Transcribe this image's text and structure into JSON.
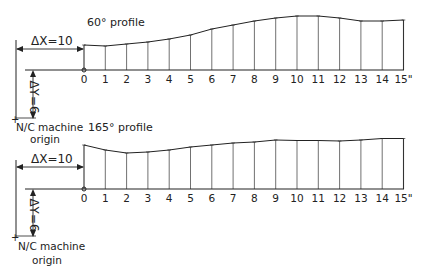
{
  "diagram": {
    "panels": [
      {
        "title": "60° profile",
        "delta_x_label": "ΔX=10",
        "delta_y_label": "ΔY=6",
        "origin_label_line1": "N/C machine",
        "origin_label_line2": "origin",
        "x_ticks": [
          "0",
          "1",
          "2",
          "3",
          "4",
          "5",
          "6",
          "7",
          "8",
          "9",
          "10",
          "11",
          "12",
          "13",
          "14",
          "15\""
        ],
        "profile_height_px": [
          25,
          24,
          26,
          28,
          31,
          35,
          41,
          45,
          49,
          52,
          54,
          54,
          52,
          49,
          49,
          50
        ]
      },
      {
        "title": "165° profile",
        "delta_x_label": "ΔX=10",
        "delta_y_label": "ΔY=6",
        "origin_label_line1": "N/C machine",
        "origin_label_line2": "origin",
        "x_ticks": [
          "0",
          "1",
          "2",
          "3",
          "4",
          "5",
          "6",
          "7",
          "8",
          "9",
          "10",
          "11",
          "12",
          "13",
          "14",
          "15\""
        ],
        "profile_height_px": [
          44,
          39,
          36,
          37,
          39,
          42,
          44,
          46,
          47,
          49,
          48.5,
          48.5,
          48,
          49,
          50.5,
          50.5
        ]
      }
    ]
  },
  "chart_data": [
    {
      "type": "line",
      "title": "60° profile",
      "x": [
        0,
        1,
        2,
        3,
        4,
        5,
        6,
        7,
        8,
        9,
        10,
        11,
        12,
        13,
        14,
        15
      ],
      "xlabel": "inches",
      "values_relative": [
        25,
        24,
        26,
        28,
        31,
        35,
        41,
        45,
        49,
        52,
        54,
        54,
        52,
        49,
        49,
        50
      ],
      "annotations": [
        "ΔX=10",
        "ΔY=6",
        "N/C machine origin"
      ]
    },
    {
      "type": "line",
      "title": "165° profile",
      "x": [
        0,
        1,
        2,
        3,
        4,
        5,
        6,
        7,
        8,
        9,
        10,
        11,
        12,
        13,
        14,
        15
      ],
      "xlabel": "inches",
      "values_relative": [
        44,
        39,
        36,
        37,
        39,
        42,
        44,
        46,
        47,
        49,
        48.5,
        48.5,
        48,
        49,
        50.5,
        50.5
      ],
      "annotations": [
        "ΔX=10",
        "ΔY=6",
        "N/C machine origin"
      ]
    }
  ]
}
